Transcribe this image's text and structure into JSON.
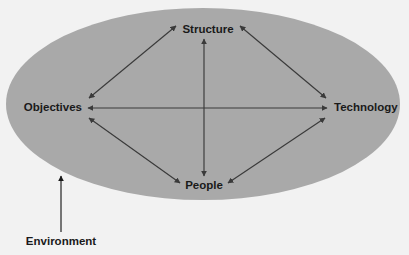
{
  "diagram": {
    "background_color": "#f2f2f2",
    "ellipse": {
      "name": "system-boundary",
      "fill_color": "#a9a9a9",
      "cx": 203,
      "cy": 104,
      "rx": 197,
      "ry": 96
    },
    "nodes": [
      {
        "id": "structure",
        "label": "Structure",
        "x": 208,
        "y": 30,
        "anchor": "middle"
      },
      {
        "id": "objectives",
        "label": "Objectives",
        "x": 82,
        "y": 108,
        "anchor": "end"
      },
      {
        "id": "technology",
        "label": "Technology",
        "x": 334,
        "y": 108,
        "anchor": "start"
      },
      {
        "id": "people",
        "label": "People",
        "x": 204,
        "y": 186,
        "anchor": "middle"
      }
    ],
    "external": {
      "id": "environment",
      "label": "Environment",
      "x": 61,
      "y": 242,
      "arrow": {
        "x1": 61,
        "y1": 232,
        "x2": 61,
        "y2": 176
      },
      "arrow_color": "#1a1a1a"
    },
    "links": [
      {
        "id": "objectives-structure",
        "from": "Objectives",
        "to": "Structure",
        "style": "double-arrow",
        "x1": 89,
        "y1": 98,
        "x2": 176,
        "y2": 26
      },
      {
        "id": "structure-technology",
        "from": "Structure",
        "to": "Technology",
        "style": "double-arrow",
        "x1": 240,
        "y1": 26,
        "x2": 326,
        "y2": 98
      },
      {
        "id": "objectives-technology",
        "from": "Objectives",
        "to": "Technology",
        "style": "double-arrow",
        "x1": 88,
        "y1": 108,
        "x2": 327,
        "y2": 108
      },
      {
        "id": "structure-people",
        "from": "Structure",
        "to": "People",
        "style": "double-arrow",
        "x1": 204,
        "y1": 39,
        "x2": 204,
        "y2": 176
      },
      {
        "id": "objectives-people",
        "from": "Objectives",
        "to": "People",
        "style": "double-arrow",
        "x1": 89,
        "y1": 118,
        "x2": 180,
        "y2": 183
      },
      {
        "id": "people-technology",
        "from": "People",
        "to": "Technology",
        "style": "double-arrow",
        "x1": 228,
        "y1": 183,
        "x2": 325,
        "y2": 118
      }
    ],
    "link_color": "#3a3a3a"
  }
}
